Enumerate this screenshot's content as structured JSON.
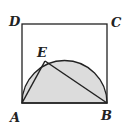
{
  "figure": {
    "type": "geometry",
    "labels": {
      "A": "A",
      "B": "B",
      "C": "C",
      "D": "D",
      "E": "E"
    },
    "points": {
      "A": [
        22,
        103
      ],
      "B": [
        107,
        103
      ],
      "C": [
        107,
        24
      ],
      "D": [
        22,
        24
      ],
      "E": [
        45,
        61
      ]
    },
    "colors": {
      "stroke": "#222222",
      "fill": "#dcdcdc",
      "background": "#ffffff"
    }
  }
}
